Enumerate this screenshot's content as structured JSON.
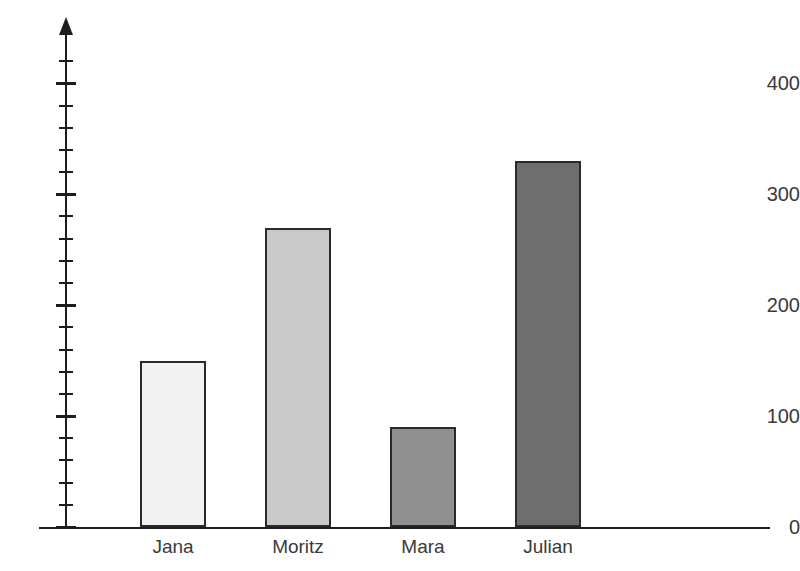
{
  "chart_data": {
    "type": "bar",
    "title": "",
    "xlabel": "",
    "ylabel": "",
    "categories": [
      "Jana",
      "Moritz",
      "Mara",
      "Julian"
    ],
    "values": [
      150,
      270,
      90,
      330
    ],
    "series": [
      {
        "name": "Anzahl",
        "values": [
          150,
          270,
          90,
          330
        ]
      }
    ],
    "ylim": [
      0,
      440
    ],
    "y_major_ticks": [
      0,
      100,
      200,
      300,
      400
    ],
    "y_tick_labels": [
      "0",
      "100",
      "200",
      "300",
      "400"
    ],
    "y_minor_tick_step": 20,
    "grid": false,
    "legend": false,
    "bar_colors": [
      "#f2f2f2",
      "#c9c9c9",
      "#909090",
      "#6e6e6e"
    ],
    "bar_border_color": "#2a2a2a",
    "axis_color": "#1d1d1d",
    "background_color": "#ffffff",
    "y_axis_has_arrow": true,
    "x_axis_has_arrow": false
  },
  "axis": {
    "y_arrow_name": "y-axis-arrowhead"
  }
}
